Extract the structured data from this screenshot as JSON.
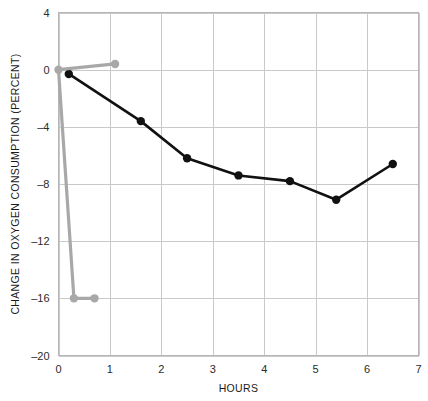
{
  "chart_data": {
    "type": "line",
    "title": "",
    "xlabel": "HOURS",
    "ylabel": "CHANGE IN OXYGEN CONSUMPTION (PERCENT)",
    "xlim": [
      0,
      7
    ],
    "ylim": [
      -20,
      4
    ],
    "xticks": [
      0,
      1,
      2,
      3,
      4,
      5,
      6,
      7
    ],
    "xtick_labels": [
      "0",
      "1",
      "2",
      "3",
      "4",
      "5",
      "6",
      "7"
    ],
    "yticks": [
      4,
      0,
      -4,
      -8,
      -12,
      -16,
      -20
    ],
    "ytick_labels": [
      "4",
      "0",
      "–4",
      "–8",
      "–12",
      "–16",
      "–20"
    ],
    "grid": true,
    "legend": "none",
    "series": [
      {
        "name": "black-series",
        "color": "#111111",
        "line_width": 2.6,
        "marker": "circle",
        "marker_size": 4.2,
        "points": [
          {
            "x": 0.2,
            "y": -0.3
          },
          {
            "x": 1.6,
            "y": -3.6
          },
          {
            "x": 2.5,
            "y": -6.2
          },
          {
            "x": 3.5,
            "y": -7.4
          },
          {
            "x": 4.5,
            "y": -7.8
          },
          {
            "x": 5.4,
            "y": -9.1
          },
          {
            "x": 6.5,
            "y": -6.6
          }
        ]
      },
      {
        "name": "gray-series",
        "color": "#a8a8a8",
        "line_width": 3.2,
        "marker": "circle",
        "marker_size": 4.2,
        "points": [
          {
            "x": 0.0,
            "y": 0.0
          },
          {
            "x": 1.1,
            "y": 0.4
          },
          {
            "x": 0.3,
            "y": -16.0
          },
          {
            "x": 0.7,
            "y": -16.0
          }
        ],
        "path_order": [
          1,
          0,
          2,
          3
        ],
        "note": "gray trace runs from x=1.1 back to x=0, drops vertically to -16, then runs right to x=0.7"
      }
    ]
  },
  "axis_labels": {
    "x_title": "HOURS",
    "y_title": "CHANGE IN OXYGEN CONSUMPTION (PERCENT)"
  }
}
